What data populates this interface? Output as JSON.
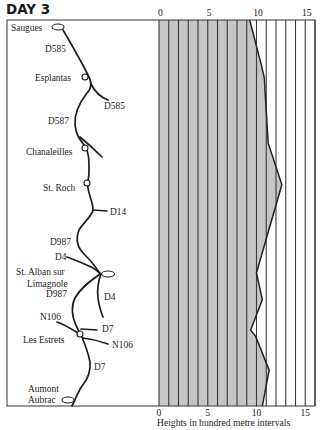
{
  "page": {
    "title": "DAY 3"
  },
  "map": {
    "places": {
      "saugues": "Saugues",
      "esplantas": "Esplantas",
      "chanaleilles": "Chanaleilles",
      "st_roch": "St. Roch",
      "st_alban_line1": "St. Alban sur",
      "st_alban_line2": "Limagnole",
      "les_estrets": "Les Estrets",
      "aumont_line1": "Aumont",
      "aumont_line2": "Aubrac"
    },
    "roads": {
      "d585_a": "D585",
      "d585_b": "D585",
      "d587": "D587",
      "d14": "D14",
      "d987_a": "D987",
      "d4_a": "D4",
      "d987_b": "D987",
      "d4_b": "D4",
      "n106_a": "N106",
      "d7_a": "D7",
      "n106_b": "N106",
      "d7_b": "D7"
    }
  },
  "chart_data": {
    "type": "area",
    "orientation": "vertical-profile",
    "title": "DAY 3",
    "xlabel": "Heights in hundred metre intervals",
    "ylabel": "",
    "x_ticks": [
      0,
      5,
      10,
      15
    ],
    "xlim": [
      0,
      16
    ],
    "grid": true,
    "grid_step": 1,
    "colors": {
      "fill": "#c6c6c6",
      "grid": "#3a3a3a",
      "line": "#222222"
    },
    "series": [
      {
        "name": "Height profile (Saugues to Aumont Aubrac)",
        "points": [
          {
            "pos": 0.0,
            "height": 9.3,
            "place": "Saugues"
          },
          {
            "pos": 0.039,
            "height": 9.7
          },
          {
            "pos": 0.078,
            "height": 10.1
          },
          {
            "pos": 0.117,
            "height": 10.5
          },
          {
            "pos": 0.15,
            "height": 10.8,
            "place": "Esplantas"
          },
          {
            "pos": 0.319,
            "height": 11.2,
            "place": "Chanaleilles"
          },
          {
            "pos": 0.427,
            "height": 12.6,
            "place": "St. Roch"
          },
          {
            "pos": 0.655,
            "height": 10.0,
            "place": "St. Alban sur Limagnole"
          },
          {
            "pos": 0.725,
            "height": 10.6
          },
          {
            "pos": 0.803,
            "height": 9.4,
            "place": "Les Estrets"
          },
          {
            "pos": 0.819,
            "height": 9.9
          },
          {
            "pos": 0.907,
            "height": 11.3
          },
          {
            "pos": 1.0,
            "height": 10.6,
            "place": "Aumont Aubrac"
          }
        ]
      }
    ]
  }
}
